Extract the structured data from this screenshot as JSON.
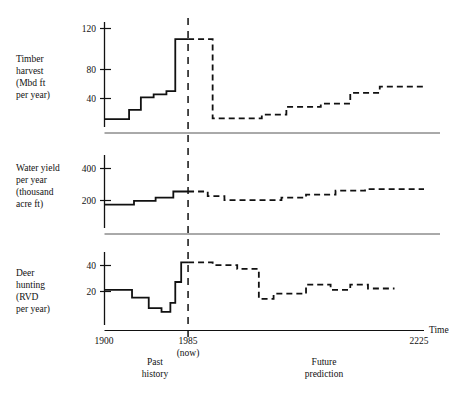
{
  "chart_data": {
    "type": "line",
    "title": "",
    "subtitle": "",
    "xlabel": "Time",
    "x_ticks": [
      "1900",
      "1985",
      "2225"
    ],
    "x_tick_values": [
      1900,
      1985,
      2225
    ],
    "xlim": [
      1900,
      2225
    ],
    "grid": false,
    "legend_position": "none",
    "annotations": [
      {
        "text": "1985",
        "kind": "x-tick-now"
      },
      {
        "text": "(now)",
        "kind": "x-tick-now-sub"
      },
      {
        "text": "Past",
        "kind": "region-label-line1"
      },
      {
        "text": "history",
        "kind": "region-label-line2"
      },
      {
        "text": "Future",
        "kind": "region-label-line1"
      },
      {
        "text": "prediction",
        "kind": "region-label-line2"
      },
      {
        "text": "Time",
        "kind": "axis-name"
      }
    ],
    "divider_year": 1985,
    "series_style": {
      "past": "solid",
      "future": "dashed"
    },
    "panels": [
      {
        "id": "timber-harvest",
        "ylabel_lines": [
          "Timber",
          "harvest",
          "(Mbd ft",
          "per year)"
        ],
        "y_ticks": [
          40,
          80,
          120
        ],
        "ylim": [
          0,
          135
        ],
        "past": {
          "x": [
            1900,
            1925,
            1925,
            1937,
            1937,
            1950,
            1950,
            1963,
            1963,
            1972,
            1972,
            1985
          ],
          "y": [
            10,
            10,
            22,
            22,
            38,
            38,
            42,
            42,
            46,
            46,
            113,
            113
          ]
        },
        "future": {
          "x": [
            1985,
            2010,
            2010,
            2060,
            2060,
            2085,
            2085,
            2120,
            2120,
            2150,
            2150,
            2180,
            2180,
            2225
          ],
          "y": [
            113,
            113,
            11,
            11,
            16,
            16,
            26,
            26,
            30,
            30,
            44,
            44,
            52,
            52
          ]
        }
      },
      {
        "id": "water-yield",
        "ylabel_lines": [
          "Water yield",
          "per year",
          "(thousand",
          "acre ft)"
        ],
        "y_ticks": [
          200,
          400
        ],
        "ylim": [
          0,
          470
        ],
        "past": {
          "x": [
            1900,
            1930,
            1930,
            1952,
            1952,
            1970,
            1970,
            1985
          ],
          "y": [
            150,
            150,
            175,
            175,
            195,
            195,
            235,
            235
          ]
        },
        "future": {
          "x": [
            1985,
            2005,
            2005,
            2022,
            2022,
            2080,
            2080,
            2105,
            2105,
            2135,
            2135,
            2165,
            2165,
            2225
          ],
          "y": [
            235,
            235,
            205,
            205,
            180,
            180,
            195,
            195,
            215,
            215,
            240,
            240,
            250,
            250
          ]
        }
      },
      {
        "id": "deer-hunting",
        "ylabel_lines": [
          "Deer",
          "hunting",
          "(RVD",
          "per year)"
        ],
        "y_ticks": [
          20,
          40
        ],
        "ylim": [
          0,
          56
        ],
        "past": {
          "x": [
            1900,
            1928,
            1928,
            1945,
            1945,
            1958,
            1958,
            1967,
            1967,
            1972,
            1972,
            1978,
            1978,
            1985
          ],
          "y": [
            27,
            27,
            21,
            21,
            13,
            13,
            10,
            10,
            17,
            17,
            33,
            33,
            48,
            48
          ]
        },
        "future": {
          "x": [
            1985,
            2010,
            2010,
            2035,
            2035,
            2057,
            2057,
            2072,
            2072,
            2105,
            2105,
            2130,
            2130,
            2150,
            2150,
            2168,
            2168,
            2195
          ],
          "y": [
            48,
            48,
            46,
            46,
            43,
            43,
            20,
            20,
            24,
            24,
            31,
            31,
            27,
            27,
            31,
            31,
            28,
            28
          ]
        }
      }
    ]
  }
}
